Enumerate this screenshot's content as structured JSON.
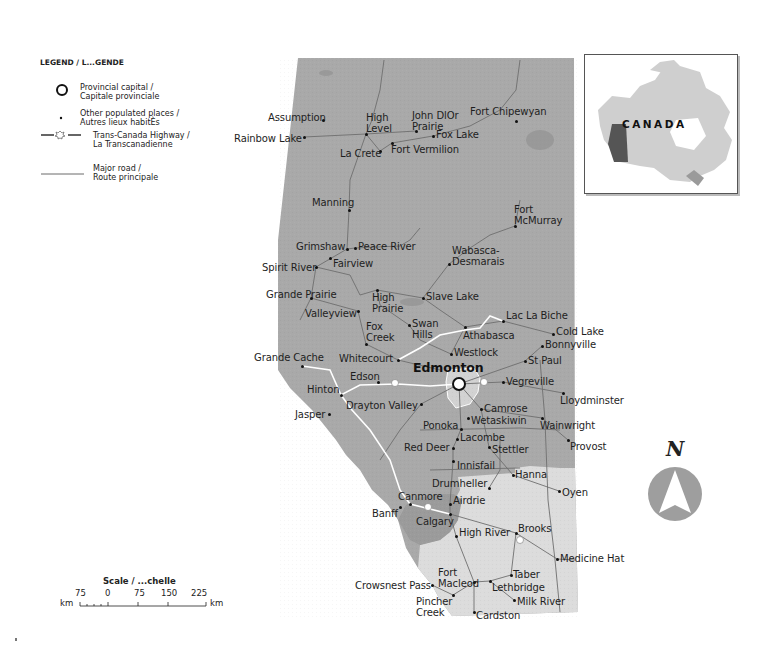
{
  "legend": {
    "title": "LEGEND / L...GENDE",
    "items": [
      {
        "symbol": "provincial-capital-circle",
        "label": "Provincial capital /\nCapitale provinciale"
      },
      {
        "symbol": "populated-place-dot",
        "label": "Other populated places /\nAutres lieux habitÈs"
      },
      {
        "symbol": "trans-canada-highway-maple-leaf",
        "label": "Trans-Canada Highway /\nLa Transcanadienne"
      },
      {
        "symbol": "major-road-line",
        "label": "Major road /\nRoute principale"
      }
    ]
  },
  "scale": {
    "title": "Scale / ...chelle",
    "ticks": [
      "75",
      "0",
      "75",
      "150",
      "225"
    ],
    "unit_left": "km",
    "unit_right": "km"
  },
  "inset": {
    "country_label": "CANADA",
    "highlighted_region": "Alberta"
  },
  "compass": {
    "label": "N"
  },
  "colors": {
    "province_dark": "#a9a9a9",
    "province_mid": "#b8b8b8",
    "prairie_light": "#dcdcdc",
    "capital_region": "#d2d2d2",
    "road": "#6e6e6e",
    "highway": "#ffffff",
    "compass_fill": "#9e9e9e",
    "inset_canada": "#cfcfcf",
    "inset_alberta": "#555555"
  },
  "map": {
    "capital": {
      "name": "Edmonton",
      "x": 459,
      "y": 384,
      "lx": 413,
      "ly": 361
    },
    "places": [
      {
        "name": "Assumption",
        "x": 323,
        "y": 120,
        "lx": 268,
        "ly": 112
      },
      {
        "name": "Rainbow Lake",
        "x": 304,
        "y": 137,
        "lx": 234,
        "ly": 133
      },
      {
        "name": "High\nLevel",
        "x": 366,
        "y": 134,
        "lx": 366,
        "ly": 112
      },
      {
        "name": "John DlOr\nPrairie",
        "x": 416,
        "y": 131,
        "lx": 412,
        "ly": 110
      },
      {
        "name": "Fox Lake",
        "x": 433,
        "y": 136,
        "lx": 436,
        "ly": 129
      },
      {
        "name": "Fort Chipewyan",
        "x": 516,
        "y": 121,
        "lx": 470,
        "ly": 106
      },
      {
        "name": "La Crete",
        "x": 380,
        "y": 151,
        "lx": 340,
        "ly": 148
      },
      {
        "name": "Fort Vermilion",
        "x": 392,
        "y": 143,
        "lx": 391,
        "ly": 144
      },
      {
        "name": "Manning",
        "x": 349,
        "y": 210,
        "lx": 312,
        "ly": 197
      },
      {
        "name": "Fort\nMcMurray",
        "x": 515,
        "y": 226,
        "lx": 514,
        "ly": 204
      },
      {
        "name": "Grimshaw",
        "x": 347,
        "y": 249,
        "lx": 296,
        "ly": 241
      },
      {
        "name": "Peace River",
        "x": 355,
        "y": 248,
        "lx": 358,
        "ly": 241
      },
      {
        "name": "Fairview",
        "x": 330,
        "y": 258,
        "lx": 333,
        "ly": 258
      },
      {
        "name": "Wabasca-\nDesmarais",
        "x": 449,
        "y": 264,
        "lx": 452,
        "ly": 245
      },
      {
        "name": "Spirit River",
        "x": 316,
        "y": 267,
        "lx": 262,
        "ly": 262
      },
      {
        "name": "Grande Prairie",
        "x": 311,
        "y": 298,
        "lx": 266,
        "ly": 289
      },
      {
        "name": "High\nPrairie",
        "x": 377,
        "y": 290,
        "lx": 372,
        "ly": 292
      },
      {
        "name": "Slave Lake",
        "x": 423,
        "y": 298,
        "lx": 426,
        "ly": 291
      },
      {
        "name": "Valleyview",
        "x": 358,
        "y": 311,
        "lx": 305,
        "ly": 308
      },
      {
        "name": "Fox\nCreek",
        "x": 366,
        "y": 344,
        "lx": 366,
        "ly": 321
      },
      {
        "name": "Swan\nHills",
        "x": 409,
        "y": 325,
        "lx": 412,
        "ly": 318
      },
      {
        "name": "Athabasca",
        "x": 465,
        "y": 327,
        "lx": 463,
        "ly": 330
      },
      {
        "name": "Lac La Biche",
        "x": 503,
        "y": 321,
        "lx": 506,
        "ly": 310
      },
      {
        "name": "Cold Lake",
        "x": 553,
        "y": 334,
        "lx": 556,
        "ly": 326
      },
      {
        "name": "Bonnyville",
        "x": 542,
        "y": 346,
        "lx": 545,
        "ly": 339
      },
      {
        "name": "Grande Cache",
        "x": 302,
        "y": 366,
        "lx": 254,
        "ly": 352
      },
      {
        "name": "Whitecourt",
        "x": 398,
        "y": 360,
        "lx": 339,
        "ly": 353
      },
      {
        "name": "Westlock",
        "x": 451,
        "y": 354,
        "lx": 454,
        "ly": 347
      },
      {
        "name": "St Paul",
        "x": 525,
        "y": 361,
        "lx": 528,
        "ly": 355
      },
      {
        "name": "Edson",
        "x": 378,
        "y": 382,
        "lx": 350,
        "ly": 371
      },
      {
        "name": "Vegreville",
        "x": 503,
        "y": 382,
        "lx": 506,
        "ly": 376
      },
      {
        "name": "Hinton",
        "x": 341,
        "y": 395,
        "lx": 307,
        "ly": 384
      },
      {
        "name": "Lloydminster",
        "x": 563,
        "y": 393,
        "lx": 560,
        "ly": 395
      },
      {
        "name": "Drayton Valley",
        "x": 421,
        "y": 404,
        "lx": 346,
        "ly": 400
      },
      {
        "name": "Camrose",
        "x": 481,
        "y": 409,
        "lx": 484,
        "ly": 403
      },
      {
        "name": "Jasper",
        "x": 329,
        "y": 414,
        "lx": 295,
        "ly": 409
      },
      {
        "name": "Wetaskiwin",
        "x": 468,
        "y": 418,
        "lx": 471,
        "ly": 415
      },
      {
        "name": "Wainwright",
        "x": 542,
        "y": 418,
        "lx": 540,
        "ly": 420
      },
      {
        "name": "Ponoka",
        "x": 461,
        "y": 429,
        "lx": 423,
        "ly": 420
      },
      {
        "name": "Lacombe",
        "x": 457,
        "y": 439,
        "lx": 460,
        "ly": 432
      },
      {
        "name": "Red Deer",
        "x": 453,
        "y": 448,
        "lx": 404,
        "ly": 442
      },
      {
        "name": "Stettler",
        "x": 489,
        "y": 447,
        "lx": 492,
        "ly": 444
      },
      {
        "name": "Provost",
        "x": 568,
        "y": 440,
        "lx": 570,
        "ly": 441
      },
      {
        "name": "Innisfail",
        "x": 453,
        "y": 461,
        "lx": 457,
        "ly": 460
      },
      {
        "name": "Hanna",
        "x": 513,
        "y": 475,
        "lx": 515,
        "ly": 469
      },
      {
        "name": "Drumheller",
        "x": 489,
        "y": 488,
        "lx": 432,
        "ly": 478
      },
      {
        "name": "Oyen",
        "x": 559,
        "y": 491,
        "lx": 562,
        "ly": 487
      },
      {
        "name": "Canmore",
        "x": 410,
        "y": 504,
        "lx": 398,
        "ly": 491
      },
      {
        "name": "Airdrie",
        "x": 450,
        "y": 504,
        "lx": 453,
        "ly": 495
      },
      {
        "name": "Banff",
        "x": 400,
        "y": 507,
        "lx": 372,
        "ly": 508
      },
      {
        "name": "Calgary",
        "x": 450,
        "y": 514,
        "lx": 416,
        "ly": 516
      },
      {
        "name": "High River",
        "x": 456,
        "y": 536,
        "lx": 459,
        "ly": 527
      },
      {
        "name": "Brooks",
        "x": 516,
        "y": 533,
        "lx": 518,
        "ly": 523
      },
      {
        "name": "Medicine Hat",
        "x": 557,
        "y": 559,
        "lx": 560,
        "ly": 553
      },
      {
        "name": "Fort\nMacleod",
        "x": 474,
        "y": 582,
        "lx": 438,
        "ly": 567
      },
      {
        "name": "Taber",
        "x": 511,
        "y": 575,
        "lx": 513,
        "ly": 569
      },
      {
        "name": "Crowsnest Pass",
        "x": 432,
        "y": 585,
        "lx": 355,
        "ly": 580
      },
      {
        "name": "Lethbridge",
        "x": 490,
        "y": 581,
        "lx": 492,
        "ly": 582
      },
      {
        "name": "Pincher\nCreek",
        "x": 453,
        "y": 595,
        "lx": 416,
        "ly": 596
      },
      {
        "name": "Milk River",
        "x": 514,
        "y": 600,
        "lx": 517,
        "ly": 596
      },
      {
        "name": "Cardston",
        "x": 474,
        "y": 612,
        "lx": 476,
        "ly": 610
      }
    ]
  }
}
